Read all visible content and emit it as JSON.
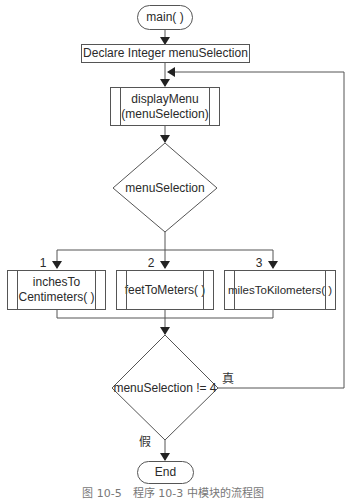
{
  "flowchart": {
    "start": "main( )",
    "declare": "Declare Integer menuSelection",
    "display_menu": {
      "line1": "displayMenu",
      "line2": "(menuSelection)"
    },
    "decision_menu": "menuSelection",
    "branches": [
      {
        "label": "1",
        "line1": "inchesTo",
        "line2": "Centimeters( )"
      },
      {
        "label": "2",
        "line1": "feetToMeters( )",
        "line2": ""
      },
      {
        "label": "3",
        "line1": "milesToKilometers( )",
        "line2": ""
      }
    ],
    "loop_decision": "menuSelection != 4",
    "true_label": "真",
    "false_label": "假",
    "end": "End"
  },
  "caption": "图 10-5　程序 10-3 中模块的流程图"
}
